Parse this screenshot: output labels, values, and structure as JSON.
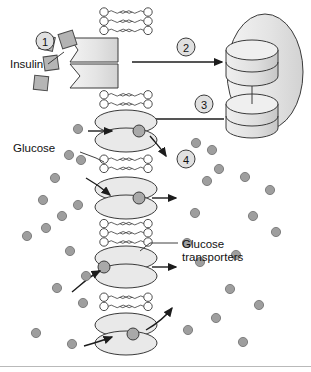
{
  "figure": {
    "type": "cell-biology-diagram"
  },
  "labels": {
    "insulin": "Insulin",
    "glucose": "Glucose",
    "glucose_transporters_line1": "Glucose",
    "glucose_transporters_line2": "transporters"
  },
  "steps": [
    {
      "id": "step-1",
      "number": "1"
    },
    {
      "id": "step-2",
      "number": "2"
    },
    {
      "id": "step-3",
      "number": "3"
    },
    {
      "id": "step-4",
      "number": "4"
    }
  ],
  "colors": {
    "outline": "#3a3a3a",
    "fill_light": "#ececec",
    "fill_mid": "#d0d0d0",
    "fill_dark": "#a9a9a9",
    "glucose_dot": "#9e9e9e",
    "insulin_square": "#b0b0b0",
    "background": "#ffffff",
    "border": "#b9b9b9",
    "text": "#111111"
  },
  "structures": {
    "membrane": "phospholipid-bilayer",
    "receptor": "insulin-receptor",
    "vesicle": "intracellular-vesicle",
    "transporter_count_membrane": 3,
    "transporter_count_vesicle": 2
  },
  "glucose_dots_left": [
    [
      78,
      129
    ],
    [
      69,
      155
    ],
    [
      81,
      160
    ],
    [
      55,
      178
    ],
    [
      43,
      200
    ],
    [
      78,
      205
    ],
    [
      62,
      216
    ],
    [
      46,
      228
    ],
    [
      27,
      236
    ],
    [
      70,
      251
    ],
    [
      86,
      276
    ],
    [
      57,
      288
    ],
    [
      83,
      303
    ],
    [
      36,
      333
    ],
    [
      72,
      344
    ]
  ],
  "glucose_dots_right": [
    [
      196,
      143
    ],
    [
      212,
      150
    ],
    [
      207,
      181
    ],
    [
      219,
      169
    ],
    [
      245,
      177
    ],
    [
      270,
      190
    ],
    [
      195,
      213
    ],
    [
      253,
      216
    ],
    [
      187,
      243
    ],
    [
      236,
      255
    ],
    [
      200,
      262
    ],
    [
      230,
      289
    ],
    [
      276,
      232
    ],
    [
      216,
      318
    ],
    [
      259,
      305
    ],
    [
      188,
      330
    ],
    [
      243,
      342
    ]
  ],
  "insulin_squares": [
    {
      "x": 45,
      "y": 40,
      "rot": -20
    },
    {
      "x": 42,
      "y": 70,
      "rot": 15
    },
    {
      "x": 66,
      "y": 54,
      "rot": 10
    },
    {
      "x": 60,
      "y": 22,
      "rot": -12
    }
  ]
}
